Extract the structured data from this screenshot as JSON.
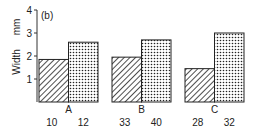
{
  "chart_data": {
    "type": "bar",
    "panel_label": "(b)",
    "title": "",
    "xlabel": "",
    "ylabel": "Width",
    "yunit": "mm",
    "ylim": [
      0,
      4
    ],
    "yticks": [
      1,
      2,
      3,
      4
    ],
    "grid": false,
    "groups": [
      {
        "label": "A",
        "bars": [
          {
            "sublabel": "10",
            "value": 1.85,
            "pattern": "hatched"
          },
          {
            "sublabel": "12",
            "value": 2.6,
            "pattern": "dotted"
          }
        ]
      },
      {
        "label": "B",
        "bars": [
          {
            "sublabel": "33",
            "value": 1.95,
            "pattern": "hatched"
          },
          {
            "sublabel": "40",
            "value": 2.7,
            "pattern": "dotted"
          }
        ]
      },
      {
        "label": "C",
        "bars": [
          {
            "sublabel": "28",
            "value": 1.45,
            "pattern": "hatched"
          },
          {
            "sublabel": "32",
            "value": 3.0,
            "pattern": "dotted"
          }
        ]
      }
    ],
    "series": [
      {
        "name": "hatched",
        "values": [
          1.85,
          1.95,
          1.45
        ]
      },
      {
        "name": "dotted",
        "values": [
          2.6,
          2.7,
          3.0
        ]
      }
    ],
    "categories": [
      "A",
      "B",
      "C"
    ]
  }
}
